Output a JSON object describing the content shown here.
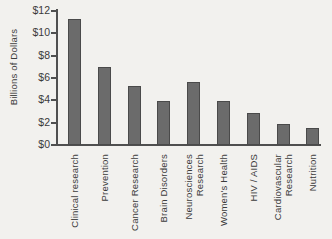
{
  "chart_data": {
    "type": "bar",
    "title": "",
    "xlabel": "",
    "ylabel": "Billions of Dollars",
    "categories": [
      "Clinical research",
      "Prevention",
      "Cancer Research",
      "Brain Disorders",
      "Neurosciences\nResearch",
      "Women's Health",
      "HIV / AIDS",
      "Cardiovascular\nResearch",
      "Nutrition"
    ],
    "values": [
      11.3,
      7.0,
      5.3,
      3.9,
      5.6,
      3.9,
      2.9,
      1.9,
      1.5
    ],
    "ylim": [
      0,
      12
    ],
    "ytick_step": 2,
    "ytick_labels": [
      "$0",
      "$2",
      "$4",
      "$6",
      "$8",
      "$10",
      "$12"
    ],
    "grid": false,
    "legend": null,
    "bar_color": "#6b6b6b",
    "bar_border_color": "#4a4a4a",
    "axis_color": "#4f4f4f",
    "text_color": "#3b3b3b",
    "background_color": "#f2f1ee"
  }
}
